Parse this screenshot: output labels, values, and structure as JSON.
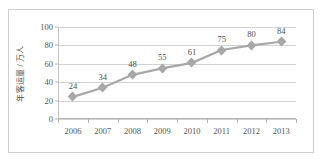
{
  "chart_data": {
    "type": "line",
    "title": "",
    "xlabel": "",
    "ylabel": "年客运量 / 万人",
    "categories": [
      "2006",
      "2007",
      "2008",
      "2009",
      "2010",
      "2011",
      "2012",
      "2013"
    ],
    "values": [
      24,
      34,
      48,
      55,
      61,
      75,
      80,
      84
    ],
    "point_labels": [
      "24",
      "34",
      "48",
      "55",
      "61",
      "75",
      "80",
      "84"
    ],
    "ylim": [
      0,
      100
    ],
    "yticks": [
      0,
      20,
      40,
      60,
      80,
      100
    ],
    "ytick_labels": [
      "0",
      "20",
      "40",
      "60",
      "80",
      "100"
    ],
    "grid": true,
    "legend": false,
    "series_color": "#a8a8a8",
    "gridline_color": "#d2d2d2",
    "axis_color": "#b5b5b5",
    "text_color": "#555555",
    "marker": "diamond",
    "frame_color": "#cfcfcf",
    "background": "#ffffff"
  }
}
